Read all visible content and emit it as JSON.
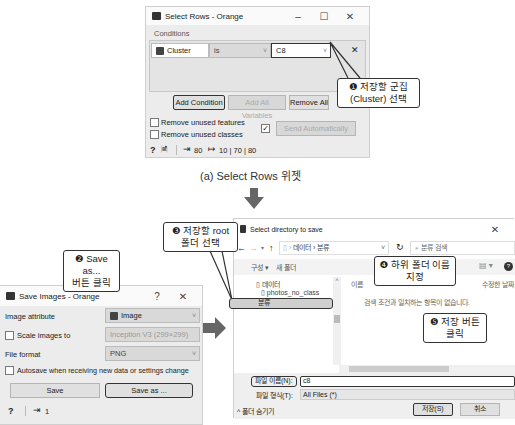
{
  "select_rows": {
    "title": "Select Rows - Orange",
    "win_controls": [
      "–",
      "☐",
      "✕"
    ],
    "conditions_label": "Conditions",
    "condition": {
      "variable": "Cluster",
      "operator": "is",
      "value": "C8",
      "remove": "✕"
    },
    "buttons": {
      "add_condition": "Add Condition",
      "add_all_variables": "Add All Variables",
      "remove_all": "Remove All"
    },
    "checkboxes": {
      "remove_unused_features": "Remove unused features",
      "remove_unused_classes": "Remove unused classes"
    },
    "send_automatically": "Send Automatically",
    "status": {
      "help": "?",
      "doc": "🗎",
      "input_count": "80",
      "output_counts": "10 | 70 | 80"
    },
    "caption": "(a) Select Rows 위젯"
  },
  "save_images": {
    "title": "Save Images - Orange",
    "win_controls": [
      "?",
      "✕"
    ],
    "image_attribute_label": "Image attribute",
    "image_attribute_value": "Image",
    "scale_images_label": "Scale images to",
    "scale_images_value": "Inception V3 (299×299)",
    "file_format_label": "File format",
    "file_format_value": "PNG",
    "autosave_label": "Autosave when receiving new data or settings change",
    "save_button": "Save",
    "save_as_button": "Save as ...",
    "status": {
      "help": "?",
      "input_count": "1"
    }
  },
  "directory_dialog": {
    "title": "Select directory to save",
    "close": "✕",
    "nav": {
      "back": "←",
      "forward": "→",
      "up": "↑",
      "breadcrumb": [
        "데이터",
        "분류"
      ],
      "refresh": "↻"
    },
    "search_placeholder": "분류 검색",
    "toolbar": {
      "organize": "구성 ▾",
      "new_folder": "새 폴더"
    },
    "tree": [
      "데이터",
      "photos_no_class",
      "분류"
    ],
    "columns": {
      "name": "이름",
      "modified": "수정한 날짜"
    },
    "empty_message": "검색 조건과 일치하는 항목이 없습니다.",
    "filename_label": "파일 이름(N):",
    "filename_value": "c8",
    "filetype_label": "파일 형식(T):",
    "filetype_value": "All Files (*)",
    "hide_folders": "^ 폴더 숨기기",
    "save_button": "저장(S)",
    "cancel_button": "취소"
  },
  "callouts": {
    "c1": "❶ 저장할 군집\n(Cluster) 선택",
    "c2": "❷ Save as...\n버튼 클릭",
    "c3": "❸ 저장할 root\n폴더 선택",
    "c4": "❹ 하위 폴더 이름\n지정",
    "c5": "❺ 저장 버튼\n클릭"
  },
  "arrows": {
    "down": "down-arrow",
    "right": "right-arrow"
  }
}
